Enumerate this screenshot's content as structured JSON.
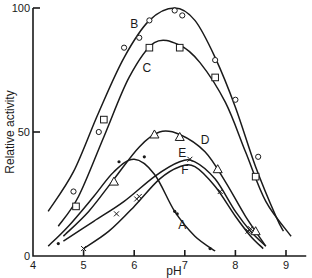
{
  "chart_data": {
    "type": "line",
    "title": "",
    "xlabel": "pH",
    "ylabel": "Relative activity",
    "xlim": [
      4,
      9.4
    ],
    "ylim": [
      0,
      100
    ],
    "xticks": [
      4,
      5,
      6,
      7,
      8,
      9
    ],
    "yticks": [
      0,
      50,
      100
    ],
    "grid": false,
    "legend": "none (curves labelled inline)",
    "series": [
      {
        "name": "A",
        "marker": "dot",
        "curve": [
          [
            4.3,
            4
          ],
          [
            4.7,
            12
          ],
          [
            5.2,
            24
          ],
          [
            5.6,
            34
          ],
          [
            6.0,
            39
          ],
          [
            6.4,
            33
          ],
          [
            6.8,
            18
          ],
          [
            7.2,
            8
          ],
          [
            7.6,
            2
          ]
        ],
        "points": [
          [
            4.5,
            5
          ],
          [
            5.7,
            38
          ],
          [
            6.2,
            40
          ],
          [
            6.8,
            18
          ],
          [
            6.85,
            17
          ],
          [
            7.5,
            3
          ]
        ],
        "label_pos": [
          6.95,
          11
        ]
      },
      {
        "name": "B",
        "marker": "circle",
        "curve": [
          [
            4.3,
            18
          ],
          [
            4.8,
            34
          ],
          [
            5.3,
            58
          ],
          [
            5.8,
            80
          ],
          [
            6.3,
            95
          ],
          [
            6.8,
            100
          ],
          [
            7.2,
            95
          ],
          [
            7.6,
            80
          ],
          [
            8.0,
            60
          ],
          [
            8.4,
            36
          ],
          [
            8.8,
            16
          ],
          [
            8.95,
            10
          ]
        ],
        "points": [
          [
            4.8,
            26
          ],
          [
            5.3,
            50
          ],
          [
            5.8,
            84
          ],
          [
            6.1,
            88
          ],
          [
            6.3,
            95
          ],
          [
            6.8,
            99
          ],
          [
            6.95,
            97
          ],
          [
            7.6,
            79
          ],
          [
            8.0,
            63
          ],
          [
            8.45,
            40
          ]
        ],
        "label_pos": [
          6.0,
          92
        ]
      },
      {
        "name": "C",
        "marker": "square",
        "curve": [
          [
            4.5,
            12
          ],
          [
            4.9,
            24
          ],
          [
            5.4,
            48
          ],
          [
            5.9,
            72
          ],
          [
            6.4,
            86
          ],
          [
            6.9,
            85
          ],
          [
            7.3,
            78
          ],
          [
            7.8,
            62
          ],
          [
            8.2,
            42
          ],
          [
            8.6,
            22
          ],
          [
            9.1,
            8
          ]
        ],
        "points": [
          [
            4.85,
            20
          ],
          [
            5.4,
            55
          ],
          [
            6.3,
            84
          ],
          [
            6.9,
            84
          ],
          [
            7.6,
            72
          ],
          [
            8.4,
            32
          ]
        ],
        "label_pos": [
          6.25,
          74
        ]
      },
      {
        "name": "D",
        "marker": "triangle",
        "curve": [
          [
            4.6,
            8
          ],
          [
            5.1,
            18
          ],
          [
            5.6,
            31
          ],
          [
            6.1,
            44
          ],
          [
            6.5,
            50
          ],
          [
            6.9,
            49
          ],
          [
            7.4,
            42
          ],
          [
            7.8,
            30
          ],
          [
            8.2,
            16
          ],
          [
            8.6,
            4
          ]
        ],
        "points": [
          [
            5.6,
            30
          ],
          [
            6.4,
            49
          ],
          [
            6.9,
            48
          ],
          [
            7.65,
            35
          ],
          [
            8.4,
            10
          ]
        ],
        "label_pos": [
          7.4,
          45
        ]
      },
      {
        "name": "E",
        "marker": "cross",
        "curve": [
          [
            4.6,
            6
          ],
          [
            5.2,
            14
          ],
          [
            5.8,
            22
          ],
          [
            6.4,
            32
          ],
          [
            6.9,
            38
          ],
          [
            7.2,
            38
          ],
          [
            7.6,
            31
          ],
          [
            8.0,
            18
          ],
          [
            8.3,
            10
          ],
          [
            8.6,
            4
          ]
        ],
        "points": [
          [
            5.65,
            17
          ],
          [
            6.1,
            24
          ],
          [
            7.1,
            39
          ],
          [
            7.7,
            26
          ],
          [
            8.3,
            11
          ]
        ],
        "label_pos": [
          6.95,
          40
        ]
      },
      {
        "name": "F",
        "marker": "cross",
        "curve": [
          [
            5.0,
            3
          ],
          [
            5.5,
            10
          ],
          [
            6.0,
            20
          ],
          [
            6.5,
            31
          ],
          [
            6.9,
            36
          ],
          [
            7.2,
            36
          ],
          [
            7.6,
            28
          ],
          [
            8.0,
            16
          ],
          [
            8.3,
            8
          ],
          [
            8.55,
            3
          ]
        ],
        "points": [
          [
            5.0,
            3
          ],
          [
            6.05,
            23
          ],
          [
            8.25,
            10
          ]
        ],
        "label_pos": [
          7.0,
          33
        ]
      }
    ]
  },
  "axes": {
    "x_label": "pH",
    "y_label": "Relative activity",
    "x_tick_labels": [
      "4",
      "5",
      "6",
      "7",
      "8",
      "9"
    ],
    "y_tick_labels": [
      "0",
      "50",
      "100"
    ]
  }
}
